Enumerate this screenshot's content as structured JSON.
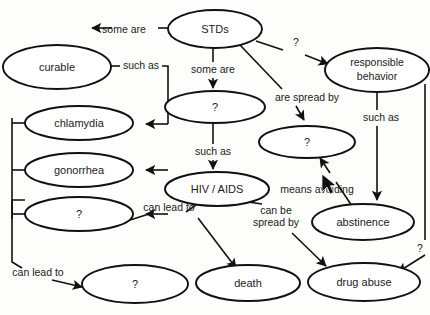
{
  "diagram": {
    "background_color": "#fdfdfb",
    "stroke_color": "#111111",
    "node_fill_color": "#ffffff",
    "nodes": [
      {
        "id": "stds",
        "label": "STDs",
        "cx": 215,
        "cy": 29,
        "rx": 47,
        "ry": 19
      },
      {
        "id": "curable",
        "label": "curable",
        "cx": 57,
        "cy": 67,
        "rx": 54,
        "ry": 22
      },
      {
        "id": "responsible",
        "label_line1": "responsible",
        "label_line2": "behavior",
        "cx": 377,
        "cy": 70,
        "rx": 52,
        "ry": 22
      },
      {
        "id": "q-center-top",
        "label": "?",
        "cx": 215,
        "cy": 107,
        "rx": 50,
        "ry": 16
      },
      {
        "id": "chlamydia",
        "label": "chlamydia",
        "cx": 79,
        "cy": 123,
        "rx": 54,
        "ry": 17
      },
      {
        "id": "q-spread",
        "label": "?",
        "cx": 307,
        "cy": 142,
        "rx": 48,
        "ry": 16
      },
      {
        "id": "gonorrhea",
        "label": "gonorrhea",
        "cx": 79,
        "cy": 170,
        "rx": 54,
        "ry": 17
      },
      {
        "id": "hiv-aids",
        "label": "HIV / AIDS",
        "cx": 217,
        "cy": 189,
        "rx": 52,
        "ry": 17
      },
      {
        "id": "q-left-third",
        "label": "?",
        "cx": 79,
        "cy": 214,
        "rx": 54,
        "ry": 17
      },
      {
        "id": "abstinence",
        "label": "abstinence",
        "cx": 363,
        "cy": 222,
        "rx": 51,
        "ry": 18
      },
      {
        "id": "q-bottom-left",
        "label": "?",
        "cx": 135,
        "cy": 284,
        "rx": 53,
        "ry": 19
      },
      {
        "id": "death",
        "label": "death",
        "cx": 248,
        "cy": 283,
        "rx": 52,
        "ry": 18
      },
      {
        "id": "drug-abuse",
        "label": "drug abuse",
        "cx": 364,
        "cy": 282,
        "rx": 56,
        "ry": 19
      }
    ],
    "edge_labels": [
      {
        "id": "some-are-1",
        "text": "some are",
        "x": 124,
        "y": 30
      },
      {
        "id": "such-as-1",
        "text": "such as",
        "x": 141,
        "y": 66
      },
      {
        "id": "q-stds-responsible",
        "text": "?",
        "x": 296,
        "y": 43
      },
      {
        "id": "some-are-2",
        "text": "some are",
        "x": 213,
        "y": 70
      },
      {
        "id": "are-spread-by",
        "text": "are spread by",
        "x": 307,
        "y": 98
      },
      {
        "id": "such-as-2",
        "text": "such as",
        "x": 381,
        "y": 118
      },
      {
        "id": "such-as-3",
        "text": "such as",
        "x": 213,
        "y": 152
      },
      {
        "id": "means-avoiding",
        "text": "means avoiding",
        "x": 317,
        "y": 190
      },
      {
        "id": "can-lead-to-1",
        "text": "can lead to",
        "x": 169,
        "y": 208
      },
      {
        "id": "can-be-spread-by-1",
        "text": "can be",
        "x": 276,
        "y": 211
      },
      {
        "id": "can-be-spread-by-2",
        "text": "spread by",
        "x": 276,
        "y": 222
      },
      {
        "id": "can-lead-to-2",
        "text": "can lead to",
        "x": 38,
        "y": 273
      },
      {
        "id": "q-right-edge",
        "text": "?",
        "x": 420,
        "y": 249
      }
    ]
  }
}
